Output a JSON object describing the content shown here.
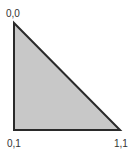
{
  "diagram": {
    "shape": "right-triangle",
    "fill": "#c8c8c8",
    "stroke": "#2a2a2a",
    "vertices": [
      {
        "id": "top-left",
        "label": "0,0",
        "x": 14,
        "y": 23
      },
      {
        "id": "bottom-left",
        "label": "0,1",
        "x": 14,
        "y": 130
      },
      {
        "id": "bottom-right",
        "label": "1,1",
        "x": 120,
        "y": 130
      }
    ]
  }
}
